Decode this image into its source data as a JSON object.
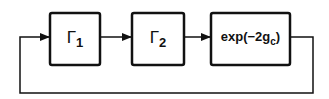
{
  "diagram": {
    "type": "block-diagram-feedback-loop",
    "blocks": [
      {
        "id": "gamma1",
        "symbol": "Γ",
        "subscript": "1"
      },
      {
        "id": "gamma2",
        "symbol": "Γ",
        "subscript": "2"
      },
      {
        "id": "exp",
        "prefix": "exp(−2g",
        "subscript": "c",
        "suffix": ")"
      }
    ],
    "edges": [
      {
        "from": "gamma1",
        "to": "gamma2"
      },
      {
        "from": "gamma2",
        "to": "exp"
      },
      {
        "from": "exp",
        "to": "gamma1",
        "kind": "feedback"
      }
    ]
  }
}
